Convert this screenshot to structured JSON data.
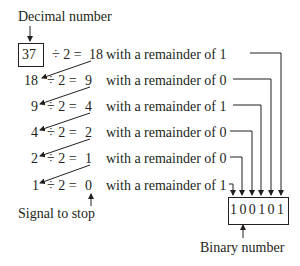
{
  "labels": {
    "decimal_number": "Decimal number",
    "signal_to_stop": "Signal to stop",
    "binary_number": "Binary number"
  },
  "start_value": "37",
  "rows": [
    {
      "dividend": "37",
      "op": "÷ 2 =",
      "quotient": "18",
      "remainder_text": "with a remainder of 1",
      "remainder": "1"
    },
    {
      "dividend": "18",
      "op": "÷ 2 =",
      "quotient": "9",
      "remainder_text": "with a remainder of 0",
      "remainder": "0"
    },
    {
      "dividend": "9",
      "op": "÷ 2 =",
      "quotient": "4",
      "remainder_text": "with a remainder of 1",
      "remainder": "1"
    },
    {
      "dividend": "4",
      "op": "÷ 2 =",
      "quotient": "2",
      "remainder_text": "with a remainder of 0",
      "remainder": "0"
    },
    {
      "dividend": "2",
      "op": "÷ 2 =",
      "quotient": "1",
      "remainder_text": "with a remainder of 0",
      "remainder": "0"
    },
    {
      "dividend": "1",
      "op": "÷ 2 =",
      "quotient": "0",
      "remainder_text": "with a remainder of 1",
      "remainder": "1"
    }
  ],
  "binary_result": "100101",
  "colors": {
    "ink": "#231f20",
    "background": "#ffffff"
  }
}
